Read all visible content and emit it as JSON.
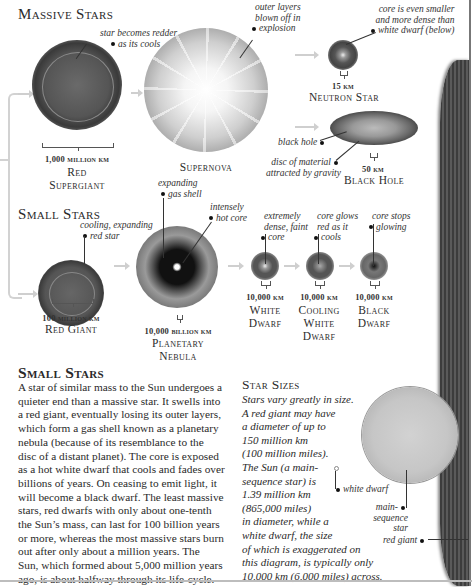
{
  "massive": {
    "title": "Massive Stars",
    "red_supergiant": {
      "label_line1": "Red",
      "label_line2": "Supergiant",
      "size": "1,000 million km",
      "annotation_line1": "star becomes redder",
      "annotation_line2": "as its cools"
    },
    "supernova": {
      "label": "Supernova",
      "annotation_line1": "outer layers",
      "annotation_line2": "blown off in",
      "annotation_line3": "explosion"
    },
    "neutron_star": {
      "label": "Neutron Star",
      "size": "15 km",
      "annotation_line1": "core is even smaller",
      "annotation_line2": "and more dense than",
      "annotation_line3": "white dwarf (below)"
    },
    "black_hole": {
      "label": "Black Hole",
      "size": "50 km",
      "annotation_hole": "black hole",
      "annotation_disc_line1": "disc of material",
      "annotation_disc_line2": "attracted by gravity"
    }
  },
  "small": {
    "title": "Small Stars",
    "red_giant": {
      "label": "Red Giant",
      "size": "100 million km",
      "annotation_line1": "cooling, expanding",
      "annotation_line2": "red star"
    },
    "planetary_nebula": {
      "label_line1": "Planetary",
      "label_line2": "Nebula",
      "size": "10,000 billion km",
      "annotation_shell_line1": "expanding",
      "annotation_shell_line2": "gas shell",
      "annotation_core_line1": "intensely",
      "annotation_core_line2": "hot core"
    },
    "white_dwarf": {
      "label_line1": "White",
      "label_line2": "Dwarf",
      "size": "10,000 km",
      "annotation_line1": "extremely",
      "annotation_line2": "dense, faint",
      "annotation_line3": "core"
    },
    "cooling_white_dwarf": {
      "label_line1": "Cooling",
      "label_line2": "White",
      "label_line3": "Dwarf",
      "size": "10,000 km",
      "annotation_line1": "core glows",
      "annotation_line2": "red as it",
      "annotation_line3": "cools"
    },
    "black_dwarf": {
      "label_line1": "Black",
      "label_line2": "Dwarf",
      "size": "10,000 km",
      "annotation_line1": "core stops",
      "annotation_line2": "glowing"
    }
  },
  "article": {
    "heading": "Small Stars",
    "lines": [
      "A star of similar mass to the Sun undergoes a",
      "quieter end than a massive star. It swells into",
      "a red giant, eventually losing its outer layers,",
      "which form a gas shell known as a planetary",
      "nebula (because of its resemblance to the",
      "disc of a distant planet). The core is exposed",
      "as a hot white dwarf that cools and fades over",
      "billions of years. On ceasing to emit light, it",
      "will become a black dwarf. The least massive",
      "stars, red dwarfs with only about one-tenth",
      "the Sun’s mass, can last for 100 billion years",
      "or more, whereas the most massive stars burn",
      "out after only about a million years. The",
      "Sun, which formed about 5,000 million years",
      "ago, is about halfway through its life-cycle."
    ]
  },
  "sizes": {
    "heading": "Star Sizes",
    "lines": [
      "Stars vary greatly in size.",
      "A red giant may have",
      "a diameter of up to",
      "150 million km",
      "(100 million miles).",
      "The Sun (a main-",
      "sequence star) is",
      "1.39 million km",
      "(865,000 miles)",
      "in diameter, while a",
      "white dwarf, the size",
      "of which is exaggerated on",
      "this diagram, is typically only",
      "10,000 km (6,000 miles) across."
    ],
    "annotation_white_dwarf": "white dwarf",
    "annotation_main_line1": "main-",
    "annotation_main_line2": "sequence star",
    "annotation_red_giant": "red giant"
  }
}
